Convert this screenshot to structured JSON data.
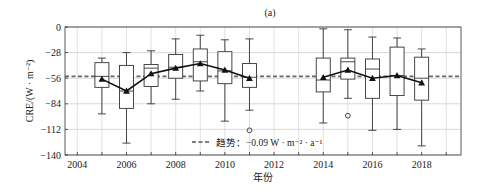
{
  "chart_data": {
    "type": "box",
    "panel_label": "(a)",
    "title": "(a)",
    "xlabel": "年份",
    "ylabel": "CRE/(W · m⁻²)",
    "ylim": [
      -140,
      0
    ],
    "xlim": [
      2003.5,
      2019.6
    ],
    "yticks": [
      0,
      -28,
      -56,
      -84,
      -112,
      -140
    ],
    "ytick_labels": [
      "0",
      "−28",
      "−56",
      "−84",
      "−112",
      "−140"
    ],
    "xticks": [
      2004,
      2006,
      2008,
      2010,
      2012,
      2014,
      2016,
      2018
    ],
    "xtick_labels": [
      "2004",
      "2006",
      "2008",
      "2010",
      "2012",
      "2014",
      "2016",
      "2018"
    ],
    "grid": true,
    "legend": {
      "position": "lower center",
      "entries": [
        {
          "style": "dashed",
          "label": "趋势：−0.09 W · m⁻² · a⁻¹"
        }
      ]
    },
    "trend": {
      "slope": -0.09,
      "unit": "W · m⁻² · a⁻¹",
      "level": -54
    },
    "years": [
      2005,
      2006,
      2007,
      2008,
      2009,
      2010,
      2011,
      2014,
      2015,
      2016,
      2017,
      2018
    ],
    "boxes": [
      {
        "year": 2005,
        "whisker_high": -34,
        "q3": -39,
        "median": -54,
        "q1": -66,
        "whisker_low": -95,
        "mean": -57,
        "outliers": []
      },
      {
        "year": 2006,
        "whisker_high": -28,
        "q3": -42,
        "median": -70,
        "q1": -89,
        "whisker_low": -127,
        "mean": -70,
        "outliers": []
      },
      {
        "year": 2007,
        "whisker_high": -26,
        "q3": -41,
        "median": -45,
        "q1": -65,
        "whisker_low": -84,
        "mean": -51,
        "outliers": []
      },
      {
        "year": 2008,
        "whisker_high": -13,
        "q3": -30,
        "median": -44,
        "q1": -56,
        "whisker_low": -79,
        "mean": -45,
        "outliers": []
      },
      {
        "year": 2009,
        "whisker_high": -9,
        "q3": -24,
        "median": -38,
        "q1": -59,
        "whisker_low": -70,
        "mean": -40,
        "outliers": []
      },
      {
        "year": 2010,
        "whisker_high": -14,
        "q3": -27,
        "median": -48,
        "q1": -62,
        "whisker_low": -103,
        "mean": -47,
        "outliers": []
      },
      {
        "year": 2011,
        "whisker_high": -13,
        "q3": -40,
        "median": -55,
        "q1": -66,
        "whisker_low": -91,
        "mean": -56,
        "outliers": [
          -113
        ]
      },
      {
        "year": 2014,
        "whisker_high": -2,
        "q3": -34,
        "median": -58,
        "q1": -71,
        "whisker_low": -105,
        "mean": -55,
        "outliers": []
      },
      {
        "year": 2015,
        "whisker_high": -3,
        "q3": -34,
        "median": -38,
        "q1": -57,
        "whisker_low": -78,
        "mean": -47,
        "outliers": [
          -97
        ]
      },
      {
        "year": 2016,
        "whisker_high": -11,
        "q3": -35,
        "median": -46,
        "q1": -78,
        "whisker_low": -113,
        "mean": -56,
        "outliers": []
      },
      {
        "year": 2017,
        "whisker_high": -12,
        "q3": -22,
        "median": -53,
        "q1": -75,
        "whisker_low": -112,
        "mean": -53,
        "outliers": []
      },
      {
        "year": 2018,
        "whisker_high": -24,
        "q3": -33,
        "median": -56,
        "q1": -80,
        "whisker_low": -130,
        "mean": -61,
        "outliers": []
      }
    ],
    "series": [
      {
        "name": "mean",
        "style": "line+triangle-marker",
        "x": [
          2005,
          2006,
          2007,
          2008,
          2009,
          2010,
          2011
        ],
        "values": [
          -57,
          -70,
          -51,
          -45,
          -40,
          -47,
          -56
        ]
      },
      {
        "name": "mean",
        "style": "line+triangle-marker",
        "x": [
          2014,
          2015,
          2016,
          2017,
          2018
        ],
        "values": [
          -55,
          -47,
          -56,
          -53,
          -61
        ]
      },
      {
        "name": "trend",
        "style": "dashed",
        "x": [
          2004.5,
          2019.2
        ],
        "values": [
          -54,
          -54
        ]
      }
    ]
  }
}
